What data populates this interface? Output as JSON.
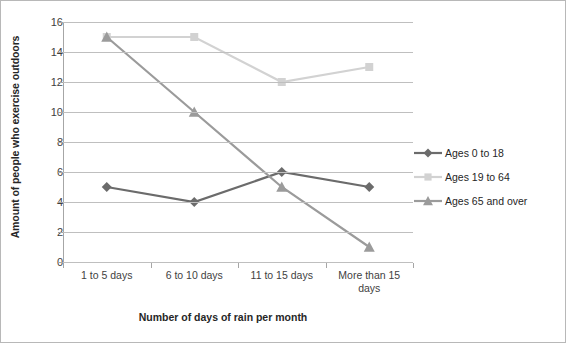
{
  "chart_data": {
    "type": "line",
    "title": "",
    "xlabel": "Number of days of rain per month",
    "ylabel": "Amount of people who exercise outdoors",
    "categories": [
      "1 to 5 days",
      "6 to 10 days",
      "11 to 15 days",
      "More than 15 days"
    ],
    "ylim": [
      0,
      16
    ],
    "yticks": [
      0,
      2,
      4,
      6,
      8,
      10,
      12,
      14,
      16
    ],
    "grid": true,
    "legend_position": "right",
    "series": [
      {
        "name": "Ages 0 to 18",
        "values": [
          5,
          4,
          6,
          5
        ],
        "color": "#6b6b6b",
        "marker": "diamond"
      },
      {
        "name": "Ages 19 to 64",
        "values": [
          15,
          15,
          12,
          13
        ],
        "color": "#d2d2d2",
        "marker": "square"
      },
      {
        "name": "Ages 65 and over",
        "values": [
          15,
          10,
          5,
          1
        ],
        "color": "#9b9b9b",
        "marker": "triangle"
      }
    ]
  }
}
